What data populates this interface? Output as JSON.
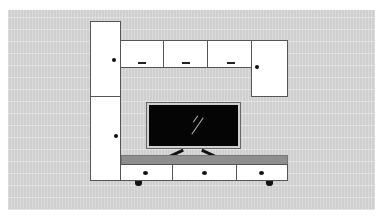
{
  "scene": {
    "type": "furniture-illustration",
    "subject": "TV wall unit with cabinets",
    "colors": {
      "wall": "#cfcfcf",
      "cabinet": "#ffffff",
      "outline": "#555555",
      "console_top": "#8e8e8e",
      "tv_screen": "#050505",
      "hardware": "#111111"
    },
    "components": {
      "left_tall_cabinet": {
        "doors": 2
      },
      "top_wall_cabinets": {
        "doors": 3
      },
      "right_wall_cabinet": {
        "doors": 1
      },
      "tv": {
        "icon": "tv-icon"
      },
      "tv_console": {
        "drawers": 3,
        "feet": 2
      }
    }
  }
}
